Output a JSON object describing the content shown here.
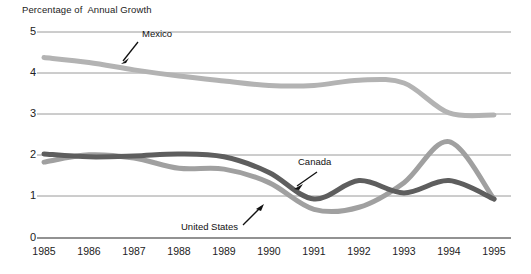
{
  "chart_data": {
    "type": "line",
    "title": "Percentage of  Annual Growth",
    "xlabel": "",
    "ylabel": "",
    "ylim": [
      0,
      5
    ],
    "yticks": [
      0,
      1,
      2,
      3,
      4,
      5
    ],
    "grid": true,
    "legend": "annotations-on-plot",
    "x": [
      1985,
      1986,
      1987,
      1988,
      1989,
      1990,
      1991,
      1992,
      1993,
      1994,
      1995
    ],
    "categories": [
      "1985",
      "1986",
      "1987",
      "1988",
      "1989",
      "1990",
      "1991",
      "1992",
      "1993",
      "1994",
      "1995"
    ],
    "series": [
      {
        "name": "Mexico",
        "color": "#b3b3b3",
        "values": [
          4.4,
          4.28,
          4.1,
          3.95,
          3.83,
          3.72,
          3.72,
          3.85,
          3.78,
          3.05,
          3.0
        ]
      },
      {
        "name": "Canada",
        "color": "#5e5e5e",
        "values": [
          2.05,
          1.98,
          2.0,
          2.05,
          1.98,
          1.6,
          0.95,
          1.4,
          1.1,
          1.4,
          0.95
        ]
      },
      {
        "name": "United States",
        "color": "#a0a0a0",
        "values": [
          1.85,
          2.03,
          1.95,
          1.7,
          1.68,
          1.35,
          0.7,
          0.75,
          1.35,
          2.35,
          0.95
        ]
      }
    ],
    "annotations": [
      {
        "label": "Mexico",
        "series": "Mexico"
      },
      {
        "label": "Canada",
        "series": "Canada"
      },
      {
        "label": "United States",
        "series": "United States"
      }
    ]
  },
  "axis": {
    "y_labels": [
      "5",
      "4",
      "3",
      "2",
      "1",
      "0"
    ],
    "x_labels": [
      "1985",
      "1986",
      "1987",
      "1988",
      "1989",
      "1990",
      "1991",
      "1992",
      "1993",
      "1994",
      "1995"
    ]
  },
  "annotations": {
    "mexico": "Mexico",
    "canada": "Canada",
    "united_states": "United States"
  },
  "colors": {
    "mexico": "#b3b3b3",
    "canada": "#5e5e5e",
    "united_states": "#a0a0a0",
    "gridline": "#9a9a9a",
    "axis": "#6e6e6e",
    "text": "#1a1a1a"
  }
}
